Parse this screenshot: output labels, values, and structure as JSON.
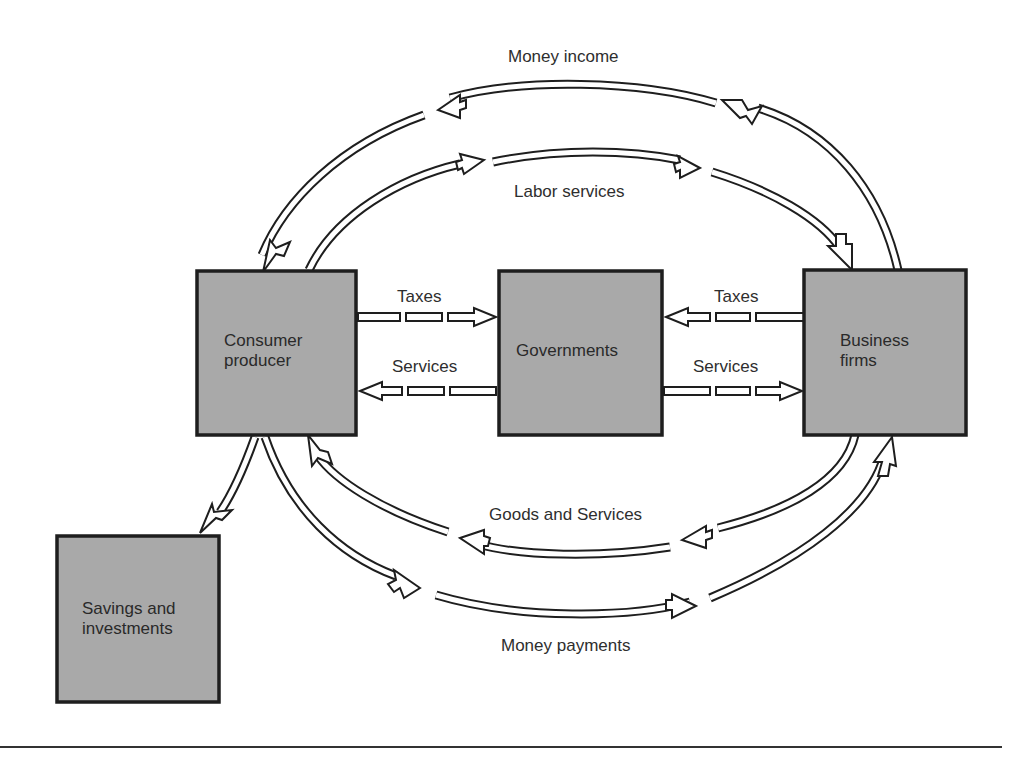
{
  "diagram": {
    "type": "circular-flow",
    "nodes": [
      {
        "id": "consumer",
        "label_line1": "Consumer",
        "label_line2": "producer"
      },
      {
        "id": "governments",
        "label_line1": "Governments"
      },
      {
        "id": "business",
        "label_line1": "Business",
        "label_line2": "firms"
      },
      {
        "id": "savings",
        "label_line1": "Savings and",
        "label_line2": "investments"
      }
    ],
    "flows": [
      {
        "label": "Money income",
        "from": "business",
        "to": "consumer"
      },
      {
        "label": "Labor services",
        "from": "consumer",
        "to": "business"
      },
      {
        "label": "Taxes",
        "from": "consumer",
        "to": "governments"
      },
      {
        "label": "Services",
        "from": "governments",
        "to": "consumer"
      },
      {
        "label": "Taxes",
        "from": "business",
        "to": "governments"
      },
      {
        "label": "Services",
        "from": "governments",
        "to": "business"
      },
      {
        "label": "Goods and Services",
        "from": "business",
        "to": "consumer"
      },
      {
        "label": "Money payments",
        "from": "consumer",
        "to": "business"
      },
      {
        "label": "",
        "from": "consumer",
        "to": "savings"
      }
    ],
    "colors": {
      "box_fill": "#a9a9a9",
      "stroke": "#1e1e1e",
      "background": "#ffffff"
    }
  }
}
